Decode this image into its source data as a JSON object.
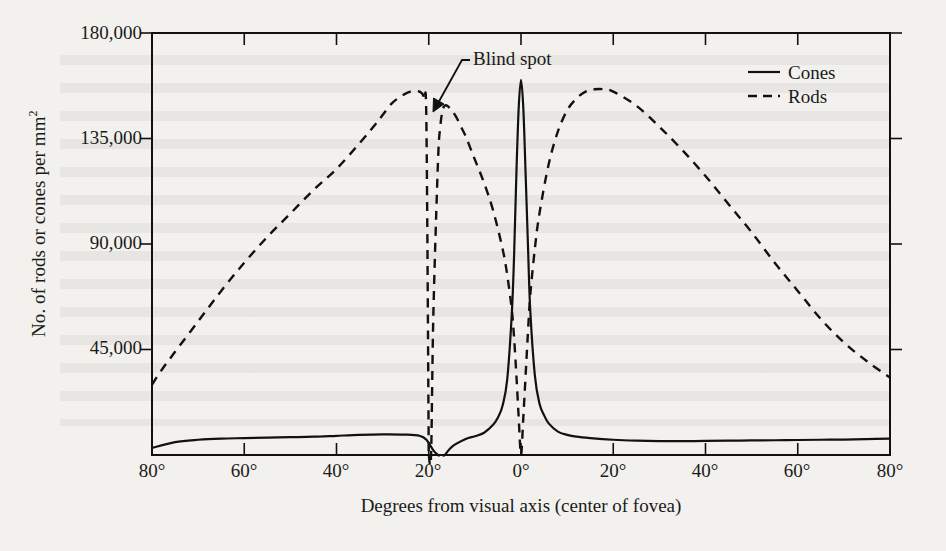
{
  "chart_data": {
    "type": "line",
    "title": "",
    "xlabel": "Degrees from visual axis (center of fovea)",
    "ylabel": "No. of rods or cones per mm²",
    "ylabel_text": "No. of rods or cones per mm",
    "ylabel_sup": "2",
    "xlim": [
      -80,
      80
    ],
    "ylim": [
      0,
      180000
    ],
    "grid": false,
    "legend_position": "top-right",
    "ytick_values": [
      180000,
      135000,
      90000,
      45000
    ],
    "ytick_labels": [
      "180,000",
      "135,000",
      "90,000",
      "45,000"
    ],
    "xtick_values": [
      -80,
      -60,
      -40,
      -20,
      0,
      20,
      40,
      60,
      80
    ],
    "xtick_labels": [
      "80°",
      "60°",
      "40°",
      "20°",
      "0°",
      "20°",
      "40°",
      "60°",
      "80°"
    ],
    "annotations": [
      {
        "text": "Blind spot",
        "x": -17,
        "y": 168000
      }
    ],
    "series": [
      {
        "name": "Cones",
        "style": "solid",
        "color": "#111111",
        "x": [
          -80,
          -75,
          -70,
          -65,
          -60,
          -55,
          -50,
          -45,
          -40,
          -35,
          -30,
          -25,
          -22,
          -20.5,
          -19,
          -18,
          -17.5,
          -17,
          -16.5,
          -15,
          -12,
          -10,
          -8,
          -6,
          -5,
          -4,
          -3,
          -2,
          -1.5,
          -1,
          -0.5,
          0,
          0.5,
          1,
          1.5,
          2,
          3,
          4,
          5,
          6,
          8,
          10,
          12,
          15,
          20,
          25,
          30,
          35,
          40,
          45,
          50,
          55,
          60,
          65,
          70,
          75,
          80
        ],
        "y": [
          3000,
          5500,
          6500,
          7000,
          7200,
          7400,
          7600,
          7800,
          8200,
          8600,
          8800,
          8700,
          8200,
          6500,
          2000,
          0,
          0,
          0,
          0,
          3500,
          6800,
          8000,
          9500,
          13000,
          16000,
          21000,
          32000,
          60000,
          85000,
          120000,
          148000,
          160000,
          148000,
          120000,
          90000,
          62000,
          34000,
          22000,
          17000,
          13500,
          10000,
          8600,
          7800,
          7200,
          6500,
          6100,
          5900,
          5900,
          6000,
          6100,
          6200,
          6300,
          6400,
          6500,
          6600,
          6800,
          7000
        ]
      },
      {
        "name": "Rods",
        "style": "dashed",
        "color": "#111111",
        "x": [
          -80,
          -78,
          -75,
          -70,
          -65,
          -60,
          -55,
          -50,
          -45,
          -40,
          -35,
          -32,
          -30,
          -28,
          -26,
          -24,
          -22,
          -21,
          -20.5,
          -20,
          -20,
          -19.5,
          -19,
          -18,
          -17.5,
          -17,
          -16.5,
          -16,
          -15,
          -14,
          -13,
          -12,
          -11,
          -10,
          -8,
          -6,
          -4,
          -3,
          -2,
          -1.5,
          -1,
          -0.5,
          0,
          0.5,
          1,
          1.5,
          2,
          3,
          4,
          6,
          8,
          10,
          12,
          14,
          16,
          18,
          20,
          25,
          30,
          35,
          40,
          45,
          50,
          55,
          60,
          65,
          70,
          75,
          80
        ],
        "y": [
          30000,
          36000,
          44000,
          57000,
          70000,
          82000,
          93000,
          103000,
          113000,
          122000,
          133000,
          140000,
          145000,
          150000,
          153000,
          155000,
          155000,
          152000,
          140000,
          0,
          0,
          0,
          60000,
          125000,
          140000,
          147000,
          149000,
          149000,
          147000,
          144000,
          140000,
          136000,
          131000,
          126000,
          116000,
          104000,
          88000,
          77000,
          62000,
          50000,
          34000,
          16000,
          0,
          16000,
          34000,
          52000,
          68000,
          88000,
          103000,
          124000,
          138000,
          147000,
          152000,
          155000,
          156000,
          156000,
          155000,
          149000,
          140000,
          130000,
          119000,
          107000,
          95000,
          82000,
          70000,
          58000,
          48000,
          40000,
          33000
        ]
      }
    ]
  },
  "legend": {
    "items": [
      {
        "label": "Cones",
        "style": "solid"
      },
      {
        "label": "Rods",
        "style": "dashed"
      }
    ]
  }
}
